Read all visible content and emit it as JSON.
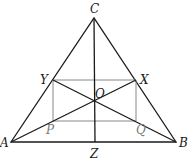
{
  "diagram": {
    "type": "geometry",
    "colors": {
      "main_line": "#1a1a1a",
      "rect_line": "#7a7a7a",
      "label": "#1a1a1a",
      "gray_label": "#7a7a7a"
    },
    "points": {
      "A": {
        "label": "A",
        "x": 11,
        "y": 142
      },
      "B": {
        "label": "B",
        "x": 176,
        "y": 142
      },
      "C": {
        "label": "C",
        "x": 94,
        "y": 18
      },
      "X": {
        "label": "X",
        "x": 136,
        "y": 80
      },
      "Y": {
        "label": "Y",
        "x": 53,
        "y": 80
      },
      "P": {
        "label": "P",
        "x": 53,
        "y": 121
      },
      "Q": {
        "label": "Q",
        "x": 136,
        "y": 121
      },
      "O": {
        "label": "O",
        "x": 95,
        "y": 102
      },
      "Z": {
        "label": "Z",
        "x": 95,
        "y": 142
      }
    },
    "segments": [
      "AB",
      "BC",
      "CA",
      "CZ",
      "AX",
      "BY",
      "YX",
      "XQ",
      "QP",
      "PY"
    ]
  }
}
